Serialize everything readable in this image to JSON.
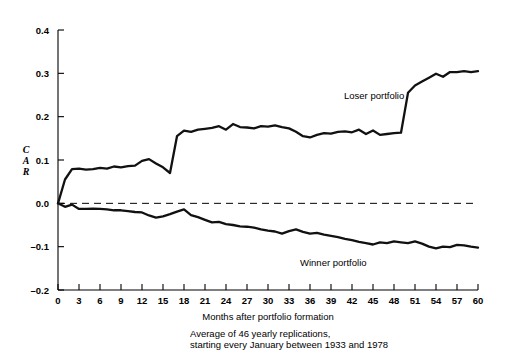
{
  "figure": {
    "background": "#ffffff",
    "line_color": "#111111"
  },
  "axis": {
    "y_label_letters": [
      "C",
      "A",
      "R"
    ],
    "y_ticks": [
      "0.4",
      "0.3",
      "0.2",
      "0.1",
      "0.0",
      "-0.1",
      "-0.2"
    ],
    "x_ticks": [
      "0",
      "3",
      "6",
      "9",
      "12",
      "15",
      "18",
      "21",
      "24",
      "27",
      "30",
      "33",
      "36",
      "39",
      "42",
      "45",
      "48",
      "51",
      "54",
      "57",
      "60"
    ],
    "x_title": "Months after portfolio formation"
  },
  "caption": {
    "line1": "Average of 46 yearly replications,",
    "line2": "starting every January between 1933 and 1978"
  },
  "series_labels": {
    "loser": "Loser portfolio",
    "winner": "Winner portfolio"
  },
  "chart_data": {
    "type": "line",
    "title": "",
    "subtitle": "",
    "xlabel": "Months after portfolio formation",
    "ylabel": "CAR",
    "xlim": [
      0,
      60
    ],
    "ylim": [
      -0.2,
      0.4
    ],
    "grid": false,
    "legend_position": "inline-annotation",
    "annotations": [
      {
        "text": "Loser portfolio",
        "x": 40,
        "y": 0.175
      },
      {
        "text": "Winner portfolio",
        "x": 33,
        "y": -0.135
      },
      {
        "text": "Average of 46 yearly replications,",
        "x": 24,
        "y": -0.3
      },
      {
        "text": "starting every January between 1933 and 1978",
        "x": 24,
        "y": -0.325
      }
    ],
    "reference_lines": [
      {
        "y": 0.0,
        "style": "dashed"
      }
    ],
    "x": [
      0,
      1,
      2,
      3,
      4,
      5,
      6,
      7,
      8,
      9,
      10,
      11,
      12,
      13,
      14,
      15,
      16,
      17,
      18,
      19,
      20,
      21,
      22,
      23,
      24,
      25,
      26,
      27,
      28,
      29,
      30,
      31,
      32,
      33,
      34,
      35,
      36,
      37,
      38,
      39,
      40,
      41,
      42,
      43,
      44,
      45,
      46,
      47,
      48,
      49,
      50,
      51,
      52,
      53,
      54,
      55,
      56,
      57,
      58,
      59,
      60
    ],
    "series": [
      {
        "name": "Loser portfolio",
        "values": [
          0.0,
          0.055,
          0.079,
          0.08,
          0.078,
          0.079,
          0.082,
          0.08,
          0.085,
          0.083,
          0.086,
          0.087,
          0.098,
          0.102,
          0.092,
          0.083,
          0.07,
          0.155,
          0.168,
          0.165,
          0.17,
          0.172,
          0.174,
          0.178,
          0.17,
          0.183,
          0.176,
          0.175,
          0.173,
          0.178,
          0.177,
          0.18,
          0.176,
          0.173,
          0.165,
          0.155,
          0.152,
          0.158,
          0.162,
          0.161,
          0.165,
          0.166,
          0.164,
          0.17,
          0.16,
          0.168,
          0.158,
          0.16,
          0.162,
          0.163,
          0.255,
          0.272,
          0.281,
          0.29,
          0.299,
          0.292,
          0.303,
          0.303,
          0.305,
          0.303,
          0.305
        ]
      },
      {
        "name": "Winner portfolio",
        "values": [
          0.0,
          -0.008,
          -0.003,
          -0.013,
          -0.013,
          -0.012,
          -0.013,
          -0.014,
          -0.016,
          -0.016,
          -0.018,
          -0.02,
          -0.021,
          -0.028,
          -0.033,
          -0.03,
          -0.025,
          -0.019,
          -0.014,
          -0.027,
          -0.032,
          -0.038,
          -0.044,
          -0.043,
          -0.048,
          -0.05,
          -0.053,
          -0.054,
          -0.056,
          -0.06,
          -0.063,
          -0.065,
          -0.07,
          -0.064,
          -0.06,
          -0.066,
          -0.07,
          -0.068,
          -0.072,
          -0.075,
          -0.078,
          -0.082,
          -0.085,
          -0.089,
          -0.092,
          -0.095,
          -0.09,
          -0.092,
          -0.088,
          -0.09,
          -0.092,
          -0.088,
          -0.093,
          -0.1,
          -0.104,
          -0.1,
          -0.101,
          -0.096,
          -0.097,
          -0.1,
          -0.102
        ]
      }
    ]
  }
}
